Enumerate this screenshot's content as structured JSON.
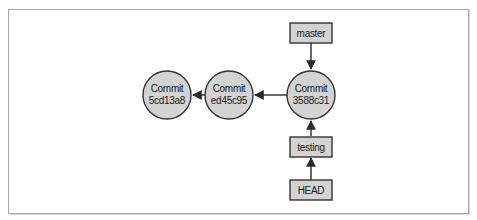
{
  "diagram": {
    "type": "git-branch-graph",
    "colors": {
      "node_fill": "#d3d3d3",
      "node_stroke": "#333333",
      "edge": "#2a2a2a",
      "frame": "#a9a9a9"
    },
    "commits": [
      {
        "id": "c1",
        "line1": "Commit",
        "line2": "5cd13a8"
      },
      {
        "id": "c2",
        "line1": "Commit",
        "line2": "ed45c95"
      },
      {
        "id": "c3",
        "line1": "Commit",
        "line2": "3588c31"
      }
    ],
    "refs": [
      {
        "id": "master",
        "label": "master",
        "points_to": "c3"
      },
      {
        "id": "testing",
        "label": "testing",
        "points_to": "c3"
      },
      {
        "id": "head",
        "label": "HEAD",
        "points_to": "testing"
      }
    ],
    "edges": [
      {
        "from": "c2",
        "to": "c1"
      },
      {
        "from": "c3",
        "to": "c2"
      },
      {
        "from": "master",
        "to": "c3"
      },
      {
        "from": "testing",
        "to": "c3"
      },
      {
        "from": "head",
        "to": "testing"
      }
    ]
  }
}
